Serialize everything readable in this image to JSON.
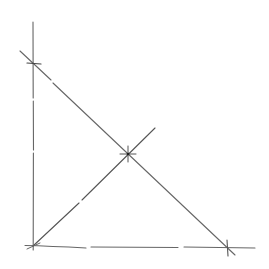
{
  "diagram": {
    "background": "#ffffff",
    "ink_color": "#5a5a5a",
    "ink_dark": "#2a2a2a",
    "axes": {
      "vertical": {
        "x1": 33,
        "y1": 22,
        "x2": 33,
        "y2": 250
      },
      "horizontal": {
        "x1": 25,
        "y1": 246,
        "x2": 255,
        "y2": 248
      }
    },
    "descending_line": {
      "x1": 20,
      "y1": 51,
      "x2": 235,
      "y2": 255
    },
    "origin_line": {
      "x1": 33,
      "y1": 246,
      "x2": 155,
      "y2": 128
    },
    "marked_points": [
      {
        "name": "y-intercept",
        "x": 33,
        "y": 63
      },
      {
        "name": "intersection",
        "x": 128,
        "y": 154
      },
      {
        "name": "x-intercept",
        "x": 227,
        "y": 248
      },
      {
        "name": "origin",
        "x": 33,
        "y": 246
      }
    ],
    "labels": []
  }
}
